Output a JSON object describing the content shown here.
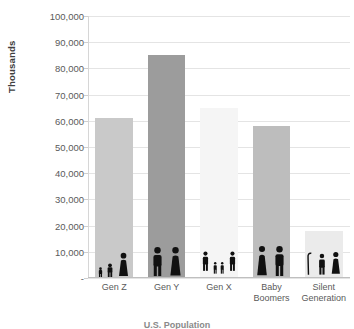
{
  "chart_data": {
    "type": "bar",
    "title": "U.S. Population",
    "xlabel": "",
    "ylabel": "Thousands",
    "categories": [
      "Gen Z",
      "Gen Y",
      "Gen X",
      "Baby Boomers",
      "Silent Generation"
    ],
    "values": [
      61000,
      85000,
      65000,
      58000,
      18000
    ],
    "ylim": [
      0,
      100000
    ],
    "yticks": [
      "-",
      "10,000",
      "20,000",
      "30,000",
      "40,000",
      "50,000",
      "60,000",
      "70,000",
      "80,000",
      "90,000",
      "100,000"
    ],
    "ytick_values": [
      0,
      10000,
      20000,
      30000,
      40000,
      50000,
      60000,
      70000,
      80000,
      90000,
      100000
    ],
    "grid": true,
    "legend": "none",
    "bar_colors": [
      "#c9c9c9",
      "#9c9c9c",
      "#f5f5f5",
      "#bdbdbd",
      "#ebebeb"
    ],
    "pictograms": [
      "baby-toddler-woman-icons",
      "young-man-young-woman-icons",
      "family-parents-children-icons",
      "man-woman-couple-icons",
      "elderly-man-elderly-woman-icons"
    ]
  },
  "axis": {
    "y_title": "Thousands"
  }
}
